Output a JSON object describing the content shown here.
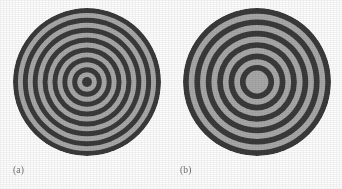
{
  "figure": {
    "background_color": "#fdfdfd",
    "width": 342,
    "height": 189,
    "caption_color": "#6f6f6f"
  },
  "colors": {
    "dark_ring": "#3a3a3a",
    "light_ring": "#a8a8a8",
    "background": "#fdfdfd",
    "label_text": "#6f6f6f"
  },
  "panels": [
    {
      "id": "a",
      "label": "(a)",
      "center_x": 87,
      "center_y": 82,
      "outer_radius": 74,
      "center_fill": "dark",
      "ring_count": 15,
      "band_width": 9.2,
      "radii": [
        74,
        64.8,
        55.6,
        46.4,
        37.2,
        28,
        18.8,
        9.6,
        5.0
      ],
      "ring_colors": [
        "#3a3a3a",
        "#a8a8a8",
        "#3a3a3a",
        "#a8a8a8",
        "#3a3a3a",
        "#a8a8a8",
        "#3a3a3a",
        "#a8a8a8",
        "#3a3a3a",
        "#a8a8a8",
        "#3a3a3a",
        "#a8a8a8",
        "#3a3a3a",
        "#a8a8a8",
        "#3a3a3a"
      ]
    },
    {
      "id": "b",
      "label": "(b)",
      "center_x": 86,
      "center_y": 82,
      "outer_radius": 74,
      "center_fill": "light",
      "ring_count": 13,
      "band_width": 10.6,
      "radii": [
        74,
        63.4,
        52.8,
        42.2,
        31.6,
        21.0,
        10.4,
        6.0
      ],
      "ring_colors": [
        "#3a3a3a",
        "#a8a8a8",
        "#3a3a3a",
        "#a8a8a8",
        "#3a3a3a",
        "#a8a8a8",
        "#3a3a3a",
        "#a8a8a8",
        "#3a3a3a",
        "#a8a8a8",
        "#3a3a3a",
        "#a8a8a8",
        "#a8a8a8"
      ]
    }
  ]
}
